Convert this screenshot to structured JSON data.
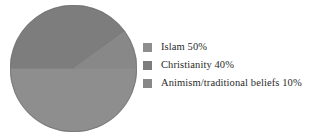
{
  "chart_data": {
    "type": "pie",
    "title": "",
    "subtitle": "",
    "xlabel": "",
    "ylabel": "",
    "grid": false,
    "legend_position": "right",
    "categories": [
      "Islam",
      "Christianity",
      "Animism/traditional beliefs"
    ],
    "values": [
      50,
      40,
      10
    ],
    "value_unit": "%",
    "labels": [
      "Islam 50%",
      "Christianity 40%",
      "Animism/traditional beliefs 10%"
    ],
    "colors": [
      "#8e8e8e",
      "#7d7d7d",
      "#888888"
    ],
    "start_angle_deg": 0,
    "direction": "clockwise",
    "background": "#ffffff",
    "text_color": "#2b2b2b"
  },
  "legend": {
    "items": [
      {
        "label": "Islam 50%",
        "name": "Islam",
        "value": "50%",
        "swatch": "#8e8e8e"
      },
      {
        "label": "Christianity 40%",
        "name": "Christianity",
        "value": "40%",
        "swatch": "#7d7d7d"
      },
      {
        "label": "Animism/traditional beliefs 10%",
        "name": "Animism/traditional beliefs",
        "value": "10%",
        "swatch": "#888888"
      }
    ]
  },
  "pie": {
    "slices": [
      {
        "name": "islam-slice",
        "percent": 50,
        "color": "#8e8e8e"
      },
      {
        "name": "christianity-slice",
        "percent": 40,
        "color": "#7d7d7d"
      },
      {
        "name": "animism-slice",
        "percent": 10,
        "color": "#888888"
      }
    ]
  }
}
